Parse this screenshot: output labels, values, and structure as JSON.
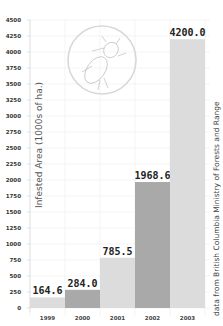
{
  "chart_data": {
    "type": "bar",
    "title": "",
    "xlabel": "",
    "ylabel": "Infested Area (1000s of ha.)",
    "categories": [
      "1999",
      "2000",
      "2001",
      "2002",
      "2003"
    ],
    "values": [
      164.6,
      284.0,
      785.5,
      1968.6,
      4200.0
    ],
    "value_labels": [
      "164.6",
      "284.0",
      "785.5",
      "1968.6",
      "4200.0"
    ],
    "bar_colors": [
      "#dcdcdc",
      "#a9a9a9",
      "#dcdcdc",
      "#a9a9a9",
      "#dcdcdc"
    ],
    "ylim": [
      0,
      4500
    ],
    "yticks": [
      0,
      250,
      500,
      750,
      1000,
      1250,
      1500,
      1750,
      2000,
      2250,
      2500,
      2750,
      3000,
      3250,
      3500,
      3750,
      4000,
      4250,
      4500
    ],
    "grid": true,
    "legend": null,
    "annotations": [
      "data from British Columbia Ministry of Forests and Range"
    ],
    "icon": "beetle-icon"
  },
  "labels": {
    "ylabel": "Infested Area (1000s of ha.)",
    "source": "data from British Columbia Ministry of Forests and Range"
  }
}
